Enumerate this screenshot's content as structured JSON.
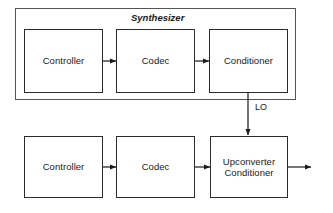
{
  "diagram": {
    "type": "block-diagram",
    "width": 333,
    "height": 213,
    "background_color": "#ffffff",
    "line_color": "#2b2b2b",
    "text_color": "#1a1a1a",
    "group": {
      "title": "Synthesizer",
      "title_style": "italic",
      "x": 15,
      "y": 8,
      "w": 281,
      "h": 92
    },
    "blocks": [
      {
        "id": "synth-controller",
        "label": "Controller",
        "x": 24,
        "y": 29,
        "w": 79,
        "h": 64
      },
      {
        "id": "synth-codec",
        "label": "Codec",
        "x": 116,
        "y": 29,
        "w": 79,
        "h": 64
      },
      {
        "id": "synth-conditioner",
        "label": "Conditioner",
        "x": 209,
        "y": 29,
        "w": 79,
        "h": 64
      },
      {
        "id": "tx-controller",
        "label": "Controller",
        "x": 24,
        "y": 136,
        "w": 79,
        "h": 62
      },
      {
        "id": "tx-codec",
        "label": "Codec",
        "x": 116,
        "y": 136,
        "w": 79,
        "h": 62
      },
      {
        "id": "tx-upconverter",
        "label": "Upconverter\nConditioner",
        "x": 210,
        "y": 136,
        "w": 78,
        "h": 62
      }
    ],
    "connections": [
      {
        "id": "synth-controller-to-codec",
        "from": "synth-controller",
        "to": "synth-codec",
        "orientation": "horizontal",
        "x1": 103,
        "y1": 61,
        "x2": 116,
        "y2": 61
      },
      {
        "id": "synth-codec-to-conditioner",
        "from": "synth-codec",
        "to": "synth-conditioner",
        "orientation": "horizontal",
        "x1": 195,
        "y1": 61,
        "x2": 209,
        "y2": 61
      },
      {
        "id": "lo-feed",
        "from": "synth-conditioner",
        "to": "tx-upconverter",
        "orientation": "vertical",
        "x1": 248,
        "y1": 93,
        "x2": 248,
        "y2": 135,
        "label": "LO",
        "label_x": 255,
        "label_y": 102
      },
      {
        "id": "tx-controller-to-codec",
        "from": "tx-controller",
        "to": "tx-codec",
        "orientation": "horizontal",
        "x1": 103,
        "y1": 167,
        "x2": 116,
        "y2": 167
      },
      {
        "id": "tx-codec-to-upconverter",
        "from": "tx-codec",
        "to": "tx-upconverter",
        "orientation": "horizontal",
        "x1": 195,
        "y1": 167,
        "x2": 210,
        "y2": 167
      },
      {
        "id": "rf-output",
        "from": "tx-upconverter",
        "to": null,
        "orientation": "horizontal",
        "x1": 288,
        "y1": 167,
        "x2": 311,
        "y2": 167
      }
    ]
  }
}
